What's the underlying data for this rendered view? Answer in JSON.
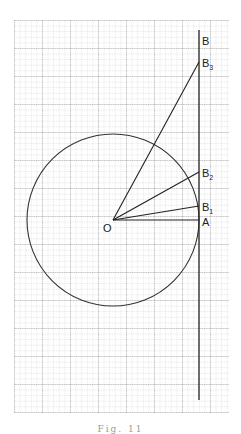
{
  "figure": {
    "type": "geometry-diagram",
    "grid": {
      "x0": 14,
      "y0": 20,
      "x1": 229,
      "y1": 413,
      "fine_step": 5.6,
      "major_every": 5
    },
    "circle": {
      "cx": 113,
      "cy": 220,
      "r": 86
    },
    "tangent_line": {
      "x": 199,
      "y_top": 30,
      "y_bottom": 400
    },
    "center_label": "O",
    "points": [
      {
        "label": "B",
        "sub": "",
        "y": 40
      },
      {
        "label": "B",
        "sub": "3",
        "y": 62
      },
      {
        "label": "B",
        "sub": "2",
        "y": 172
      },
      {
        "label": "B",
        "sub": "1",
        "y": 206
      },
      {
        "label": "A",
        "sub": "",
        "y": 220
      }
    ]
  },
  "caption": "Fig. 11"
}
